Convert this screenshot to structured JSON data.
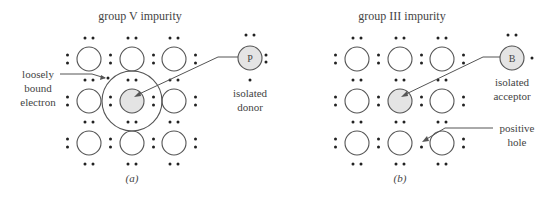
{
  "panel_a": {
    "title": "group V impurity",
    "caption": "(a)",
    "annotation_electron": [
      "loosely",
      "bound",
      "electron"
    ],
    "isolated_atom_symbol": "P",
    "isolated_label": [
      "isolated",
      "donor"
    ]
  },
  "panel_b": {
    "title": "group III impurity",
    "caption": "(b)",
    "isolated_atom_symbol": "B",
    "isolated_label": [
      "isolated",
      "acceptor"
    ],
    "annotation_hole": [
      "positive",
      "hole"
    ]
  },
  "colors": {
    "stroke": "#555555",
    "impurity_fill": "#e4e4e4",
    "dot": "#222222",
    "text": "#444444"
  }
}
